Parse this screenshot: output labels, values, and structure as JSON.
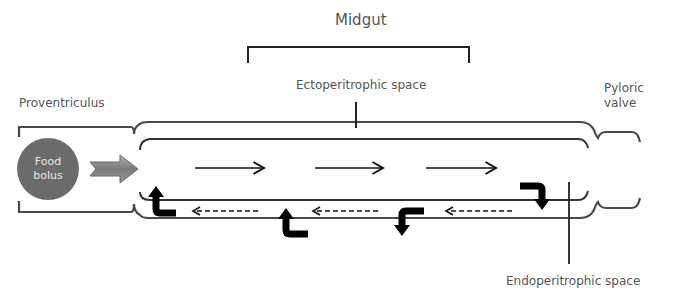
{
  "title": "Midgut",
  "labels": {
    "midgut": "Midgut",
    "ectoperitrophic": "Ectoperitrophic space",
    "endoperitrophic": "Endoperitrophic space",
    "proventriculus": "Proventriculus",
    "pyloric_line1": "Pyloric",
    "pyloric_line2": "valve",
    "food_line1": "Food",
    "food_line2": "bolus"
  },
  "colors": {
    "outline": "#4a4a4a",
    "food_bolus": "#6b6b6b",
    "block_arrow": "#8a8a8a",
    "flow_arrow": "#111111",
    "text": "#555555"
  },
  "flow": {
    "forward_arrows": 3,
    "backward_dashed_arrows": 3,
    "bent_arrows": 4
  }
}
